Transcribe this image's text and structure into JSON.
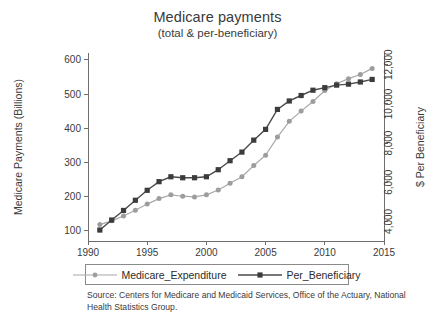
{
  "chart_data": {
    "type": "line",
    "title": "Medicare payments",
    "subtitle": "(total & per-beneficiary)",
    "xlabel": "",
    "ylabel": "Medicare Payments (Billions)",
    "y2label": "$ Per Beneficiary",
    "xlim": [
      1990,
      2015
    ],
    "ylim": [
      70,
      620
    ],
    "y2lim": [
      3000,
      12600
    ],
    "grid": false,
    "legend_position": "below-axes",
    "xticks": [
      1990,
      1995,
      2000,
      2005,
      2010,
      2015
    ],
    "xtick_labels": [
      "1990",
      "1995",
      "2000",
      "2005",
      "2010",
      "2015"
    ],
    "yticks": [
      100,
      200,
      300,
      400,
      500,
      600
    ],
    "ytick_labels": [
      "100",
      "200",
      "300",
      "400",
      "500",
      "600"
    ],
    "y2ticks": [
      4000,
      6000,
      8000,
      10000,
      12000
    ],
    "y2tick_labels": [
      "4,000",
      "6,000",
      "8,000",
      "10,000",
      "12,000"
    ],
    "x": [
      1991,
      1992,
      1993,
      1994,
      1995,
      1996,
      1997,
      1998,
      1999,
      2000,
      2001,
      2002,
      2003,
      2004,
      2005,
      2006,
      2007,
      2008,
      2009,
      2010,
      2011,
      2012,
      2013,
      2014
    ],
    "series": [
      {
        "name": "Medicare_Expenditure",
        "axis": "left",
        "units": "billions",
        "color": "#9d9d9d",
        "marker": "circle",
        "values": [
          118,
          129,
          143,
          160,
          178,
          194,
          205,
          201,
          199,
          205,
          219,
          239,
          258,
          291,
          321,
          374,
          420,
          450,
          478,
          510,
          530,
          545,
          557,
          575
        ]
      },
      {
        "name": "Per_Beneficiary",
        "axis": "right",
        "units": "dollars",
        "color": "#3c3c3c",
        "marker": "square",
        "values": [
          3560,
          4070,
          4560,
          5080,
          5590,
          6030,
          6280,
          6230,
          6230,
          6280,
          6640,
          7100,
          7540,
          8150,
          8700,
          9720,
          10150,
          10430,
          10700,
          10830,
          10960,
          11010,
          11120,
          11250
        ]
      }
    ],
    "series_left_equivalent_for_plotting": {
      "Per_Beneficiary_as_left_scale": [
        100,
        127,
        152,
        178,
        204,
        226,
        239,
        236,
        236,
        239,
        257,
        280,
        302,
        333,
        361,
        413,
        435,
        449,
        463,
        470,
        476,
        479,
        484,
        491
      ]
    },
    "source_note": "Source: Centers for Medicare and Medicaid Services, Office of the Actuary, National Health Statistics Group."
  },
  "legend": {
    "entries": [
      {
        "label": "Medicare_Expenditure",
        "marker": "circle-marker"
      },
      {
        "label": "Per_Beneficiary",
        "marker": "square-marker"
      }
    ]
  }
}
